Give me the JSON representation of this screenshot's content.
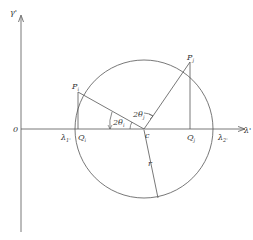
{
  "diagram": {
    "axes": {
      "y_label": "γ'",
      "x_label": "λ'",
      "origin_label": "0"
    },
    "points": {
      "P_i": "P",
      "P_i_sub": "i",
      "P_j": "P",
      "P_j_sub": "j",
      "Q_i": "Q",
      "Q_i_sub": "i",
      "Q_j": "Q",
      "Q_j_sub": "j",
      "C": "c",
      "lambda1": "λ",
      "lambda1_sub": "1'",
      "lambda2": "λ",
      "lambda2_sub": "2'"
    },
    "angles": {
      "theta_i": "2θ",
      "theta_i_sub": "i",
      "theta_j": "2θ",
      "theta_j_sub": "j"
    },
    "radius_label": "r",
    "colors": {
      "line": "#555555",
      "text": "#333333",
      "background": "#ffffff"
    }
  }
}
